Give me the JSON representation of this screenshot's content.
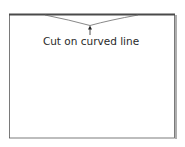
{
  "diagram": {
    "annotation": "Cut on curved line",
    "colors": {
      "outline": "#5a5a5a",
      "top_edge": "#4a4a4a",
      "shadow": "#9a9a9a",
      "curve": "#6a6a6a",
      "arrow": "#222222",
      "text": "#2a2a2a"
    }
  }
}
